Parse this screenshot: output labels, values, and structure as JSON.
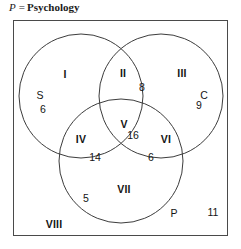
{
  "caption": {
    "symbol": "P",
    "equals": "=",
    "word": "Psychology"
  },
  "diagram": {
    "type": "venn3",
    "set_labels": [
      {
        "name": "S",
        "text": "S",
        "x": 26,
        "y": 74
      },
      {
        "name": "C",
        "text": "C",
        "x": 190,
        "y": 74
      },
      {
        "name": "P",
        "text": "P",
        "x": 160,
        "y": 192
      }
    ],
    "regions": [
      {
        "name": "region-i",
        "roman": "I",
        "value": "6",
        "roman_x": 51,
        "roman_y": 53,
        "value_x": 29,
        "value_y": 88
      },
      {
        "name": "region-ii",
        "roman": "II",
        "value": "8",
        "roman_x": 109,
        "roman_y": 52,
        "value_x": 128,
        "value_y": 66
      },
      {
        "name": "region-iii",
        "roman": "III",
        "value": "9",
        "roman_x": 168,
        "roman_y": 52,
        "value_x": 185,
        "value_y": 84
      },
      {
        "name": "region-iv",
        "roman": "IV",
        "value": "14",
        "roman_x": 67,
        "roman_y": 118,
        "value_x": 81,
        "value_y": 136
      },
      {
        "name": "region-v",
        "roman": "V",
        "value": "16",
        "roman_x": 110,
        "roman_y": 103,
        "value_x": 119,
        "value_y": 114
      },
      {
        "name": "region-vi",
        "roman": "VI",
        "value": "6",
        "roman_x": 152,
        "roman_y": 118,
        "value_x": 137,
        "value_y": 136
      },
      {
        "name": "region-vii",
        "roman": "VII",
        "value": "5",
        "roman_x": 110,
        "roman_y": 168,
        "value_x": 72,
        "value_y": 177
      },
      {
        "name": "region-viii",
        "roman": "VIII",
        "value": "11",
        "roman_x": 40,
        "roman_y": 203,
        "value_x": 199,
        "value_y": 191
      }
    ],
    "geometry": {
      "circles": [
        {
          "name": "circle-s",
          "cx": 67,
          "cy": 75,
          "r": 62
        },
        {
          "name": "circle-c",
          "cx": 147,
          "cy": 75,
          "r": 62
        },
        {
          "name": "circle-p",
          "cx": 107,
          "cy": 140,
          "r": 62
        }
      ],
      "stroke": "#3c3c3c",
      "stroke_width": 1
    }
  }
}
